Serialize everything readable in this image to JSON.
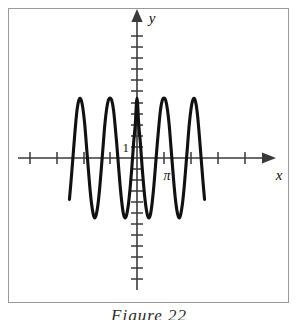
{
  "figure": {
    "caption": "Figure 22",
    "background_color": "#ffffff",
    "frame_color": "#9a9a9a",
    "curve_color": "#111111",
    "axis_color": "#3a3a3a"
  },
  "axes": {
    "x_label": "x",
    "y_label": "y",
    "x_tick_label": "π",
    "y_tick_label": "1"
  },
  "chart_data": {
    "type": "line",
    "title": "Figure 22",
    "xlabel": "x",
    "ylabel": "y",
    "grid": false,
    "legend": null,
    "function": "y = cos(2x)",
    "amplitude": 1,
    "period": 3.141592653589793,
    "xlim": [
      -4.1,
      4.1
    ],
    "ylim": [
      -2.4,
      3.6
    ],
    "x_tick_values": [
      -3.141592653589793,
      -1.5707963267948966,
      1.5707963267948966,
      3.141592653589793
    ],
    "x_tick_labels": [
      "",
      "",
      "",
      "π"
    ],
    "y_tick_values": [
      1
    ],
    "y_tick_labels": [
      "1"
    ],
    "x": [
      -3.93,
      -3.83,
      -3.73,
      -3.63,
      -3.53,
      -3.44,
      -3.34,
      -3.24,
      -3.14,
      -3.04,
      -2.95,
      -2.85,
      -2.75,
      -2.65,
      -2.55,
      -2.46,
      -2.36,
      -2.26,
      -2.16,
      -2.06,
      -1.96,
      -1.87,
      -1.77,
      -1.67,
      -1.57,
      -1.47,
      -1.37,
      -1.28,
      -1.18,
      -1.08,
      -0.98,
      -0.88,
      -0.79,
      -0.69,
      -0.59,
      -0.49,
      -0.39,
      -0.29,
      -0.2,
      -0.1,
      0.0,
      0.1,
      0.2,
      0.29,
      0.39,
      0.49,
      0.59,
      0.69,
      0.79,
      0.88,
      0.98,
      1.08,
      1.18,
      1.28,
      1.37,
      1.47,
      1.57,
      1.67,
      1.77,
      1.87,
      1.96,
      2.06,
      2.16,
      2.26,
      2.36,
      2.46,
      2.55,
      2.65,
      2.75,
      2.85,
      2.95,
      3.04,
      3.14,
      3.24,
      3.34,
      3.44,
      3.53,
      3.63,
      3.73,
      3.83,
      3.93
    ],
    "y": [
      -0.69,
      -0.36,
      0.0,
      0.36,
      0.69,
      0.89,
      0.99,
      0.96,
      0.81,
      0.56,
      0.24,
      -0.12,
      -0.47,
      -0.75,
      -0.93,
      -1.0,
      -0.93,
      -0.75,
      -0.47,
      -0.12,
      0.24,
      0.56,
      0.81,
      0.96,
      1.0,
      0.96,
      0.81,
      0.56,
      0.24,
      -0.12,
      -0.47,
      -0.75,
      -0.93,
      -1.0,
      -0.93,
      -0.75,
      -0.47,
      -0.12,
      0.24,
      0.56,
      1.0,
      0.56,
      0.24,
      -0.12,
      -0.47,
      -0.75,
      -0.93,
      -1.0,
      -0.93,
      -0.75,
      -0.47,
      -0.12,
      0.24,
      0.56,
      0.81,
      0.96,
      1.0,
      0.96,
      0.81,
      0.56,
      0.24,
      -0.12,
      -0.47,
      -0.75,
      -0.93,
      -1.0,
      -0.93,
      -0.75,
      -0.47,
      -0.12,
      0.24,
      0.56,
      0.81,
      0.96,
      0.99,
      0.89,
      0.69,
      0.36,
      0.0,
      -0.36,
      -0.69
    ]
  }
}
